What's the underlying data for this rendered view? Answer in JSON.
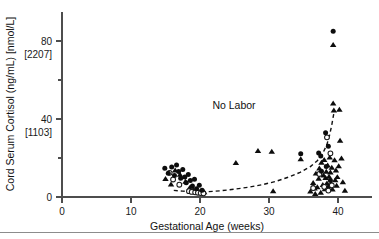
{
  "chart_data": {
    "type": "scatter",
    "title": "",
    "xlabel": "Gestational Age (weeks)",
    "ylabel": "Cord Serum Cortisol (ng/mL) [nmol/L]",
    "xlim": [
      0,
      45
    ],
    "ylim": [
      0,
      95
    ],
    "grid": false,
    "legend_position": "none",
    "xticks": [
      0,
      10,
      20,
      30,
      40
    ],
    "xticklabels": [
      "0",
      "10",
      "20",
      "30",
      "40"
    ],
    "yticks": [
      0,
      20,
      40,
      60,
      80
    ],
    "yticklabels": [
      "0",
      "",
      "40",
      "",
      "80"
    ],
    "ysecondary_labels": [
      {
        "primary": "80",
        "secondary": "[2207]",
        "y": 80
      },
      {
        "primary": "40",
        "secondary": "[1103]",
        "y": 40
      },
      {
        "primary": "0",
        "secondary": "",
        "y": 0
      }
    ],
    "annotations": [
      {
        "text": "No Labor",
        "x": 23.5,
        "y": 48
      }
    ],
    "series": [
      {
        "name": "filled-circle",
        "marker": "filled-circle",
        "points": [
          [
            14.9,
            14.8
          ],
          [
            15.4,
            12.2
          ],
          [
            15.9,
            15.4
          ],
          [
            16.3,
            11.0
          ],
          [
            16.6,
            16.4
          ],
          [
            16.9,
            13.1
          ],
          [
            17.2,
            9.6
          ],
          [
            17.5,
            14.1
          ],
          [
            17.8,
            10.2
          ],
          [
            18.0,
            7.3
          ],
          [
            18.3,
            11.6
          ],
          [
            18.6,
            8.4
          ],
          [
            18.9,
            5.6
          ],
          [
            19.2,
            9.1
          ],
          [
            19.5,
            4.2
          ],
          [
            19.9,
            6.0
          ],
          [
            20.3,
            3.4
          ],
          [
            34.6,
            22.2
          ],
          [
            37.2,
            22.6
          ],
          [
            37.5,
            21.0
          ],
          [
            37.6,
            13.2
          ],
          [
            38.2,
            33.0
          ],
          [
            38.3,
            15.6
          ],
          [
            38.6,
            26.0
          ],
          [
            38.9,
            8.4
          ],
          [
            39.3,
            85.0
          ]
        ]
      },
      {
        "name": "open-circle",
        "marker": "open-circle",
        "points": [
          [
            15.6,
            12.4
          ],
          [
            16.1,
            9.0
          ],
          [
            17.0,
            6.3
          ],
          [
            18.4,
            3.0
          ],
          [
            18.8,
            2.6
          ],
          [
            19.3,
            2.4
          ],
          [
            19.7,
            2.2
          ],
          [
            20.1,
            2.0
          ],
          [
            20.5,
            1.9
          ],
          [
            36.4,
            4.6
          ],
          [
            37.3,
            11.8
          ],
          [
            38.0,
            5.2
          ],
          [
            38.4,
            30.6
          ],
          [
            38.6,
            3.3
          ],
          [
            38.9,
            22.4
          ],
          [
            39.1,
            6.0
          ]
        ]
      },
      {
        "name": "triangle",
        "marker": "triangle",
        "points": [
          [
            15.0,
            9.2
          ],
          [
            15.8,
            6.4
          ],
          [
            16.4,
            13.6
          ],
          [
            17.1,
            11.4
          ],
          [
            17.9,
            7.8
          ],
          [
            18.5,
            4.6
          ],
          [
            19.0,
            3.6
          ],
          [
            19.6,
            3.0
          ],
          [
            20.0,
            2.7
          ],
          [
            20.6,
            2.4
          ],
          [
            25.2,
            17.4
          ],
          [
            28.4,
            23.6
          ],
          [
            30.4,
            23.2
          ],
          [
            30.6,
            3.0
          ],
          [
            34.6,
            19.4
          ],
          [
            36.0,
            2.8
          ],
          [
            36.4,
            7.2
          ],
          [
            36.6,
            4.4
          ],
          [
            36.8,
            12.0
          ],
          [
            37.0,
            5.0
          ],
          [
            37.2,
            9.4
          ],
          [
            37.3,
            14.6
          ],
          [
            37.5,
            2.2
          ],
          [
            37.6,
            17.6
          ],
          [
            37.8,
            6.2
          ],
          [
            37.9,
            11.0
          ],
          [
            38.0,
            19.0
          ],
          [
            38.1,
            4.0
          ],
          [
            38.2,
            9.8
          ],
          [
            38.3,
            13.0
          ],
          [
            38.4,
            7.0
          ],
          [
            38.5,
            16.2
          ],
          [
            38.6,
            5.4
          ],
          [
            38.7,
            10.4
          ],
          [
            38.8,
            20.2
          ],
          [
            38.9,
            12.6
          ],
          [
            39.0,
            6.8
          ],
          [
            39.1,
            15.0
          ],
          [
            39.2,
            3.8
          ],
          [
            39.3,
            78.0
          ],
          [
            39.3,
            48.0
          ],
          [
            39.4,
            44.4
          ],
          [
            39.5,
            18.8
          ],
          [
            39.6,
            8.6
          ],
          [
            39.7,
            13.6
          ],
          [
            39.8,
            5.8
          ],
          [
            39.9,
            10.2
          ],
          [
            40.1,
            15.8
          ],
          [
            40.2,
            44.8
          ],
          [
            40.3,
            28.8
          ],
          [
            40.5,
            19.8
          ],
          [
            40.7,
            7.6
          ],
          [
            41.0,
            3.2
          ],
          [
            36.7,
            1.6
          ]
        ]
      }
    ],
    "trend_line": {
      "name": "no-labor-trend",
      "style": "dashed",
      "points": [
        [
          16.2,
          3.4
        ],
        [
          17.5,
          3.0
        ],
        [
          19.0,
          2.6
        ],
        [
          21.0,
          2.7
        ],
        [
          23.0,
          3.2
        ],
        [
          25.0,
          4.0
        ],
        [
          27.0,
          5.0
        ],
        [
          29.0,
          6.3
        ],
        [
          31.0,
          8.0
        ],
        [
          33.0,
          10.4
        ],
        [
          34.5,
          12.6
        ],
        [
          36.0,
          15.6
        ],
        [
          37.0,
          18.6
        ],
        [
          37.8,
          22.4
        ],
        [
          38.4,
          27.0
        ],
        [
          38.8,
          32.0
        ],
        [
          39.1,
          37.0
        ],
        [
          39.4,
          43.0
        ]
      ]
    }
  }
}
